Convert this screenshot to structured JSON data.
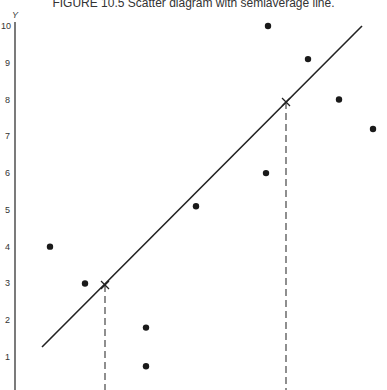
{
  "chart_data": {
    "type": "scatter",
    "title": "FIGURE 10.5 Scatter diagram with semiaverage line.",
    "xlabel": "",
    "ylabel": "Y",
    "ylim": [
      0,
      10
    ],
    "y_ticks": [
      "10",
      "9",
      "8",
      "7",
      "6",
      "5",
      "4",
      "3",
      "2",
      "1"
    ],
    "grid": false,
    "points": [
      {
        "x": 1,
        "y": 4.0
      },
      {
        "x": 2,
        "y": 3.0
      },
      {
        "x": 3.7,
        "y": 1.8
      },
      {
        "x": 3.7,
        "y": 0.75
      },
      {
        "x": 5,
        "y": 5.1
      },
      {
        "x": 7,
        "y": 6.0
      },
      {
        "x": 7,
        "y": 10.0
      },
      {
        "x": 8.2,
        "y": 9.1
      },
      {
        "x": 9,
        "y": 8.0
      },
      {
        "x": 10,
        "y": 7.2
      }
    ],
    "semiaverage_line": {
      "start": {
        "x": 0.8,
        "y": 1.3
      },
      "end": {
        "x": 9.6,
        "y": 10.0
      },
      "semiaverage_points": [
        {
          "label": "first half mean",
          "x": 2.5,
          "y": 3.0
        },
        {
          "label": "second half mean",
          "x": 7.6,
          "y": 7.9
        }
      ]
    }
  },
  "title": "FIGURE 10.5 Scatter diagram with semiaverage line.",
  "axis": {
    "y_label": "Y"
  }
}
